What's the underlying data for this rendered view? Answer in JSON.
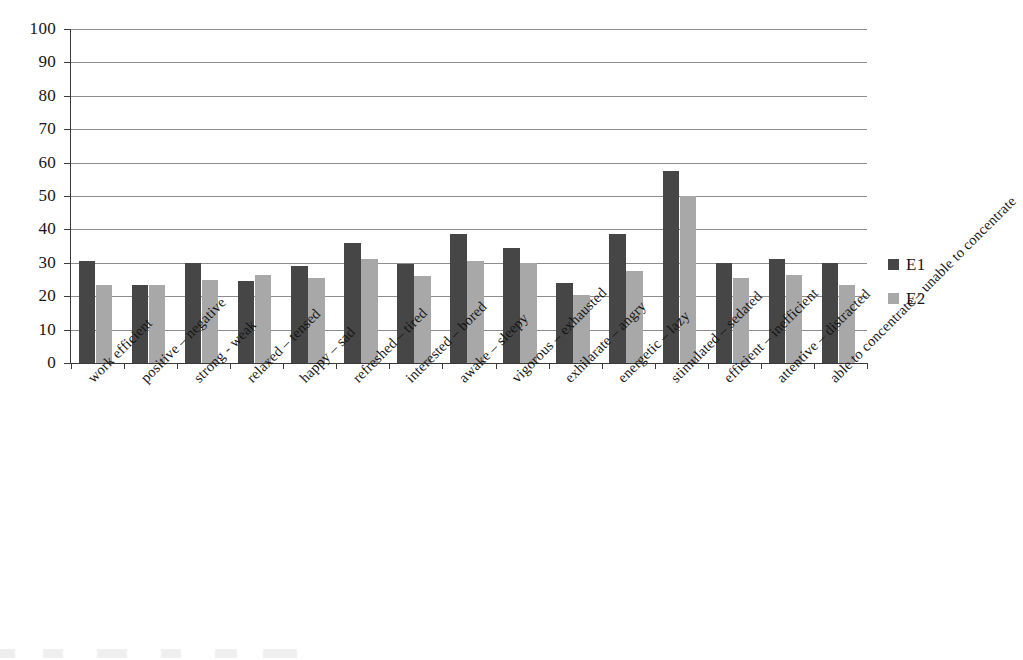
{
  "chart_data": {
    "type": "bar",
    "title": "",
    "subtitle": "",
    "xlabel": "",
    "ylabel": "",
    "ylim": [
      0,
      100
    ],
    "yticks": [
      0,
      10,
      20,
      30,
      40,
      50,
      60,
      70,
      80,
      90,
      100
    ],
    "grid": true,
    "legend_position": "right",
    "categories": [
      "work efficient",
      "positive – negative",
      "strong - weak",
      "relaxed – tensed",
      "happy – sad",
      "refreshed – tired",
      "interested – bored",
      "awake – sleepy",
      "vigorous – exhausted",
      "exhilarate – angry",
      "energetic – lazy",
      "stimulated – sedated",
      "efficient – inefficient",
      "attentive – distracted",
      "able to concentrate – unable to concentrate"
    ],
    "series": [
      {
        "name": "E1",
        "color": "#464646",
        "values": [
          30.5,
          23.5,
          30.0,
          24.5,
          29.0,
          36.0,
          29.5,
          38.5,
          34.5,
          24.0,
          38.5,
          57.5,
          30.0,
          31.0,
          30.0
        ]
      },
      {
        "name": "E2",
        "color": "#a8a8a8",
        "values": [
          23.5,
          23.5,
          25.0,
          26.5,
          25.5,
          31.0,
          26.0,
          30.5,
          30.0,
          20.5,
          27.5,
          50.0,
          25.5,
          26.5,
          23.5
        ]
      }
    ]
  },
  "legend": {
    "items": [
      {
        "label": "E1",
        "color": "#464646"
      },
      {
        "label": "E2",
        "color": "#a8a8a8"
      }
    ]
  },
  "axis": {
    "y_tick_labels": [
      "100",
      "90",
      "80",
      "70",
      "60",
      "50",
      "40",
      "30",
      "20",
      "10",
      "0"
    ]
  }
}
